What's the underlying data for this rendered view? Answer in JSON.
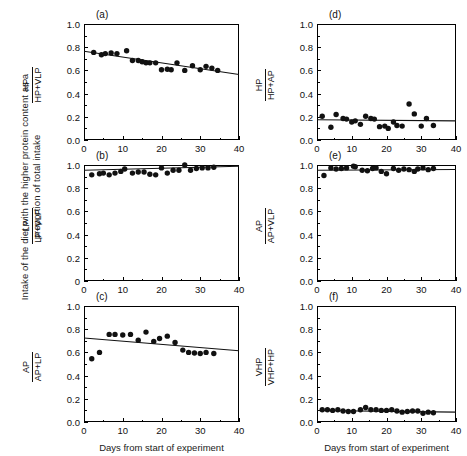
{
  "figure": {
    "global_ylabel": "Intake of the diet with the higher protein content as a proportion of total intake",
    "xlabel": "Days from start of experiment",
    "y_ticks": [
      "0.0",
      "0.2",
      "0.4",
      "0.6",
      "0.8",
      "1.0"
    ],
    "y_ticks_b": [
      "0",
      "0.2",
      "0.4",
      "0.6",
      "0.8",
      "1.0"
    ],
    "x_ticks": [
      "0",
      "10",
      "20",
      "30",
      "40"
    ]
  },
  "chart_data": [
    {
      "type": "scatter",
      "panel": "(a)",
      "title": "",
      "xlabel": "Days from start of experiment",
      "ylabel_numerator": "HP",
      "ylabel_denominator": "HP+VLP",
      "xlim": [
        0,
        40
      ],
      "ylim": [
        0.0,
        1.0
      ],
      "grid": false,
      "x": [
        2.5,
        4.5,
        5.5,
        7,
        8.5,
        11,
        12.5,
        14,
        15,
        16,
        17,
        18.5,
        20,
        21.5,
        22.5,
        24,
        26,
        28,
        30,
        31.5,
        33,
        34.5
      ],
      "y": [
        0.755,
        0.735,
        0.745,
        0.75,
        0.745,
        0.77,
        0.685,
        0.685,
        0.675,
        0.665,
        0.665,
        0.665,
        0.605,
        0.61,
        0.605,
        0.665,
        0.6,
        0.64,
        0.605,
        0.635,
        0.62,
        0.6
      ],
      "fit": {
        "x0": 0,
        "y0": 0.765,
        "x1": 40,
        "y1": 0.565
      }
    },
    {
      "type": "scatter",
      "panel": "(b)",
      "title": "",
      "xlabel": "Days from start of experiment",
      "ylabel_numerator": "LP",
      "ylabel_denominator": "LP+VLP",
      "xlim": [
        0,
        40
      ],
      "ylim": [
        0.0,
        1.0
      ],
      "grid": false,
      "x": [
        2,
        4,
        5,
        6.5,
        8,
        9.5,
        10.5,
        12.5,
        14,
        15.5,
        17,
        18.5,
        20,
        21.5,
        23,
        24.5,
        26,
        27.5,
        29,
        30.5,
        32,
        33.5
      ],
      "y": [
        0.915,
        0.925,
        0.93,
        0.915,
        0.93,
        0.945,
        0.965,
        0.93,
        0.94,
        0.94,
        0.92,
        0.915,
        0.975,
        0.93,
        0.955,
        0.955,
        1.0,
        0.955,
        0.97,
        0.975,
        0.975,
        0.98
      ],
      "fit": {
        "x0": 0,
        "y0": 0.955,
        "x1": 40,
        "y1": 0.99
      }
    },
    {
      "type": "scatter",
      "panel": "(c)",
      "title": "",
      "xlabel": "Days from start of experiment",
      "ylabel_numerator": "AP",
      "ylabel_denominator": "AP+LP",
      "xlim": [
        0,
        40
      ],
      "ylim": [
        0.0,
        1.0
      ],
      "grid": false,
      "x": [
        2,
        4,
        6.5,
        8,
        10,
        12,
        14,
        16,
        18,
        19.5,
        21.5,
        23.5,
        25.5,
        27,
        28.5,
        30,
        31.5,
        33.5
      ],
      "y": [
        0.545,
        0.6,
        0.755,
        0.755,
        0.75,
        0.755,
        0.705,
        0.775,
        0.695,
        0.72,
        0.74,
        0.685,
        0.62,
        0.6,
        0.595,
        0.59,
        0.6,
        0.59
      ],
      "fit": {
        "x0": 0,
        "y0": 0.725,
        "x1": 40,
        "y1": 0.615
      }
    },
    {
      "type": "scatter",
      "panel": "(d)",
      "title": "",
      "xlabel": "Days from start of experiment",
      "ylabel_numerator": "HP",
      "ylabel_denominator": "HP+AP",
      "xlim": [
        0,
        40
      ],
      "ylim": [
        0.0,
        1.0
      ],
      "grid": false,
      "x": [
        1.5,
        4,
        5.5,
        7.5,
        8.5,
        10,
        11,
        12.5,
        14,
        15.5,
        16.5,
        18,
        19.5,
        20.5,
        22,
        23,
        24.5,
        26.5,
        28,
        30,
        31.5,
        33.5
      ],
      "y": [
        0.205,
        0.11,
        0.22,
        0.185,
        0.18,
        0.155,
        0.165,
        0.135,
        0.205,
        0.185,
        0.18,
        0.115,
        0.12,
        0.1,
        0.155,
        0.125,
        0.12,
        0.31,
        0.225,
        0.12,
        0.185,
        0.125
      ],
      "fit": {
        "x0": 0,
        "y0": 0.175,
        "x1": 40,
        "y1": 0.165
      }
    },
    {
      "type": "scatter",
      "panel": "(e)",
      "title": "",
      "xlabel": "Days from start of experiment",
      "ylabel_numerator": "AP",
      "ylabel_denominator": "AP+VLP",
      "xlim": [
        0,
        40
      ],
      "ylim": [
        0.0,
        1.0
      ],
      "grid": false,
      "x": [
        2,
        4,
        5.5,
        7,
        8.5,
        10.5,
        11,
        13,
        14.5,
        16,
        17,
        18.5,
        20,
        22,
        23.5,
        25,
        26.5,
        28,
        29,
        30.5,
        32,
        33.5
      ],
      "y": [
        0.91,
        0.975,
        0.965,
        0.97,
        0.975,
        0.99,
        0.985,
        0.955,
        0.95,
        0.97,
        0.975,
        0.945,
        0.925,
        0.97,
        0.955,
        0.965,
        0.96,
        0.945,
        0.965,
        0.975,
        0.96,
        0.97
      ],
      "fit": {
        "x0": 0,
        "y0": 0.955,
        "x1": 40,
        "y1": 0.962
      }
    },
    {
      "type": "scatter",
      "panel": "(f)",
      "title": "",
      "xlabel": "Days from start of experiment",
      "ylabel_numerator": "VHP",
      "ylabel_denominator": "VHP+HP",
      "xlim": [
        0,
        40
      ],
      "ylim": [
        0.0,
        1.0
      ],
      "grid": false,
      "x": [
        1.5,
        3,
        4.5,
        6,
        7.5,
        9,
        10.5,
        12.5,
        14,
        15.5,
        17,
        18.5,
        20,
        21.5,
        23,
        24.5,
        26,
        27.5,
        29,
        30.5,
        32,
        33.5
      ],
      "y": [
        0.105,
        0.105,
        0.1,
        0.105,
        0.095,
        0.09,
        0.09,
        0.105,
        0.125,
        0.105,
        0.105,
        0.1,
        0.1,
        0.105,
        0.095,
        0.085,
        0.09,
        0.095,
        0.095,
        0.075,
        0.085,
        0.08
      ],
      "fit": {
        "x0": 0,
        "y0": 0.1,
        "x1": 40,
        "y1": 0.085
      }
    }
  ]
}
